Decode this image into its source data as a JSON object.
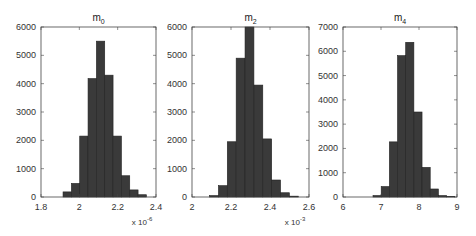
{
  "chart_data": [
    {
      "type": "bar",
      "title": "m_0",
      "title_base": "m",
      "title_sub": "0",
      "x_exponent": "x 10",
      "x_exponent_power": "-6",
      "xlim": [
        1.8,
        2.4
      ],
      "ylim": [
        0,
        6000
      ],
      "xticks": [
        "1.8",
        "2",
        "2.2",
        "2.4"
      ],
      "yticks": [
        "0",
        "1000",
        "2000",
        "3000",
        "4000",
        "5000",
        "6000"
      ],
      "bin_start": 1.915,
      "bin_width": 0.0435,
      "values": [
        180,
        480,
        2150,
        4180,
        5500,
        4300,
        2150,
        750,
        250,
        80
      ]
    },
    {
      "type": "bar",
      "title": "m_2",
      "title_base": "m",
      "title_sub": "2",
      "x_exponent": "x 10",
      "x_exponent_power": "-3",
      "xlim": [
        2.0,
        2.6
      ],
      "ylim": [
        0,
        6000
      ],
      "xticks": [
        "2",
        "2.2",
        "2.4",
        "2.6"
      ],
      "yticks": [
        "0",
        "1000",
        "2000",
        "3000",
        "4000",
        "5000",
        "6000"
      ],
      "bin_start": 2.09,
      "bin_width": 0.0455,
      "values": [
        50,
        400,
        1950,
        4900,
        6000,
        3950,
        2050,
        600,
        150,
        30
      ]
    },
    {
      "type": "bar",
      "title": "m_4",
      "title_base": "m",
      "title_sub": "4",
      "x_exponent": "",
      "x_exponent_power": "",
      "xlim": [
        6,
        9
      ],
      "ylim": [
        0,
        7000
      ],
      "xticks": [
        "6",
        "7",
        "8",
        "9"
      ],
      "yticks": [
        "0",
        "1000",
        "2000",
        "3000",
        "4000",
        "5000",
        "6000",
        "7000"
      ],
      "bin_start": 6.79,
      "bin_width": 0.215,
      "values": [
        60,
        430,
        2270,
        5820,
        6370,
        3500,
        1220,
        330,
        60,
        20
      ]
    }
  ],
  "style": {
    "bar_color": "#3a3a3a",
    "axis_color": "#444444"
  }
}
